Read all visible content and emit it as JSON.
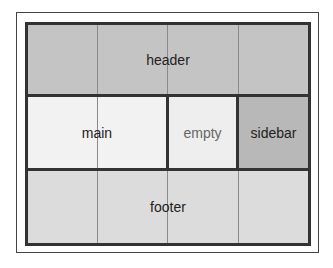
{
  "diagram": {
    "areas": {
      "header": {
        "label": "header",
        "color": "#c4c4c4"
      },
      "main": {
        "label": "main",
        "color": "#f2f2f2"
      },
      "empty": {
        "label": "empty",
        "color": "#eeeeee",
        "text_color": "#666666"
      },
      "sidebar": {
        "label": "sidebar",
        "color": "#b8b8b8"
      },
      "footer": {
        "label": "footer",
        "color": "#dcdcdc"
      }
    },
    "grid": {
      "columns": 4,
      "rows": 3
    }
  }
}
